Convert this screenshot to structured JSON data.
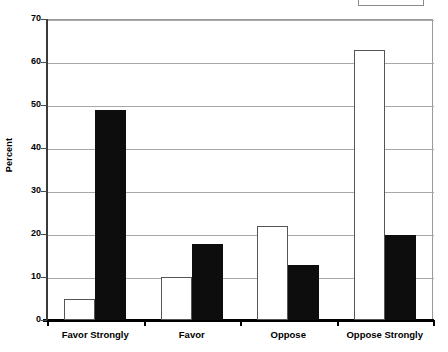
{
  "chart_data": {
    "type": "bar",
    "title": "",
    "xlabel": "",
    "ylabel": "Percent",
    "ylim": [
      0,
      70
    ],
    "ytick_values": [
      70,
      60,
      50,
      40,
      30,
      20,
      10,
      0
    ],
    "ytick_labels": [
      "70",
      "60",
      "50",
      "40",
      "30",
      "20",
      "10",
      "0"
    ],
    "grid": true,
    "legend_position": "top-right",
    "legend_clipped": true,
    "legend_entries": [],
    "categories": [
      "Favor Strongly",
      "Favor",
      "Oppose",
      "Oppose Strongly"
    ],
    "series": [
      {
        "name": "white-series",
        "fill": "#ffffff",
        "edge": "#555555",
        "values": [
          4.9,
          10.0,
          21.8,
          62.8
        ]
      },
      {
        "name": "black-series",
        "fill": "#0d0d0d",
        "edge": "#0d0d0d",
        "values": [
          48.9,
          17.7,
          12.7,
          19.7
        ]
      }
    ]
  },
  "colors": {
    "background": "#ffffff",
    "gridline": "#a8a8a8",
    "axis": "#000000",
    "series_white": "#ffffff",
    "series_black": "#0d0d0d"
  }
}
